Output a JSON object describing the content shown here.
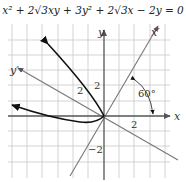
{
  "equation": "x² + 2√3xy + 3y² + 2√3x − 2y = 0",
  "axes": {
    "x_label": "x",
    "y_label": "y",
    "x_prime_label": "x′",
    "y_prime_label": "y′"
  },
  "ticks": {
    "x_pos": "2",
    "y_pos": "2",
    "y_neg": "−2",
    "x_prime_tick": "2",
    "y_prime_tick": "2"
  },
  "angle_label": "60°",
  "colors": {
    "grid": "#c8c8c8",
    "axis": "#555555",
    "rotated_axis": "#777777",
    "curve": "#111111"
  }
}
